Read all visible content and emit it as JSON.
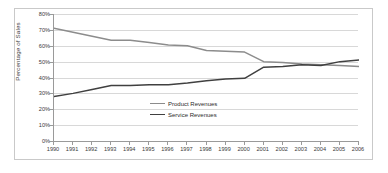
{
  "chart_data": {
    "type": "line",
    "title": "",
    "xlabel": "",
    "ylabel": "Percentage of Sales",
    "x": [
      1990,
      1991,
      1992,
      1993,
      1994,
      1995,
      1996,
      1997,
      1998,
      1999,
      2000,
      2001,
      2002,
      2003,
      2004,
      2005,
      2006
    ],
    "categories": [
      "1990",
      "1991",
      "1992",
      "1993",
      "1994",
      "1995",
      "1996",
      "1997",
      "1998",
      "1999",
      "2000",
      "2001",
      "2002",
      "2003",
      "2004",
      "2005",
      "2006"
    ],
    "ylim": [
      0,
      80
    ],
    "ytick_values": [
      0,
      10,
      20,
      30,
      40,
      50,
      60,
      70,
      80
    ],
    "ytick_labels": [
      "0%",
      "10%",
      "20%",
      "30%",
      "40%",
      "50%",
      "60%",
      "70%",
      "80%"
    ],
    "grid": true,
    "legend_position": "center",
    "series": [
      {
        "name": "Product Revenues",
        "color": "#8c8c8c",
        "values": [
          71,
          68.5,
          66,
          63.5,
          63.5,
          62,
          60.5,
          60,
          57,
          56.5,
          56,
          50,
          49.5,
          48.5,
          48,
          47.5,
          47
        ]
      },
      {
        "name": "Service Revenues",
        "color": "#404040",
        "values": [
          28,
          30,
          32.5,
          35,
          35,
          35.5,
          35.5,
          36.5,
          38,
          39,
          39.5,
          46.5,
          47,
          48,
          47.5,
          50,
          51
        ]
      }
    ]
  },
  "axes": {
    "y_axis_title": "Percentage of Sales"
  },
  "legend": {
    "items": [
      {
        "label": "Product Revenues"
      },
      {
        "label": "Service Revenues"
      }
    ]
  },
  "colors": {
    "product_line": "#8c8c8c",
    "service_line": "#404040",
    "gridline": "#d8d8d8",
    "axis": "#9a9a9a",
    "frame": "#c9c9c9",
    "background": "#ffffff"
  }
}
